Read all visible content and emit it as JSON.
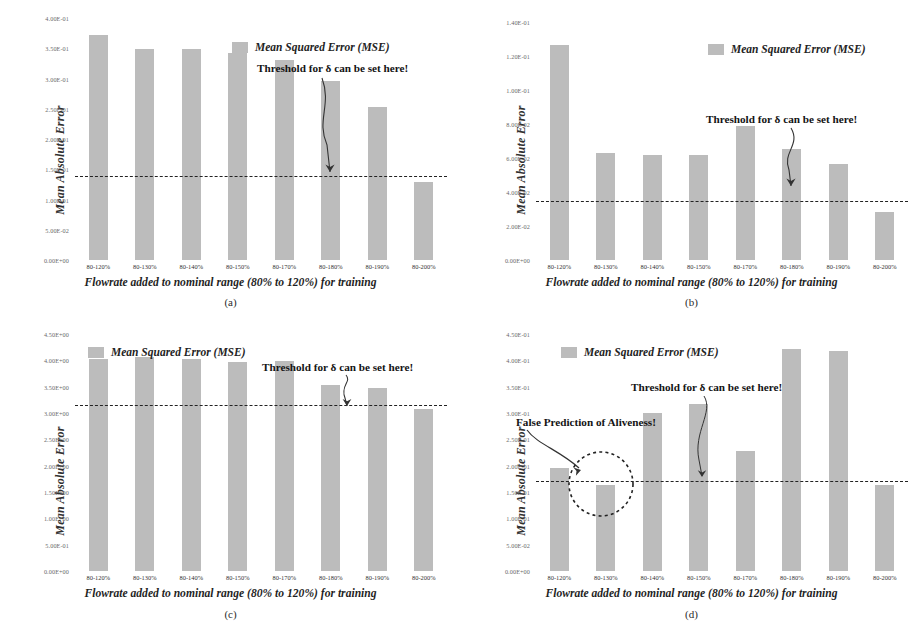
{
  "figure": {
    "bar_color": "#bcbcbc",
    "threshold_color": "#222222",
    "legend_label": "Mean Squared Error (MSE)",
    "ylabel": "Mean Absolute Error",
    "xtitle": "Flowrate added to nominal range (80% to 120%) for training",
    "threshold_annotation": "Threshold for δ can be set here!",
    "false_prediction_annotation": "False Prediction of Aliveness!"
  },
  "panels": [
    {
      "id": "a",
      "label": "(a)",
      "chart_data": {
        "type": "bar",
        "title": "",
        "xlabel": "Flowrate added to nominal range (80% to 120%) for training",
        "ylabel": "Mean Absolute Error",
        "legend": [
          "Mean Squared Error (MSE)"
        ],
        "legend_position": "top-right",
        "grid": false,
        "categories": [
          "80-120%",
          "80-130%",
          "80-140%",
          "80-150%",
          "80-170%",
          "80-180%",
          "80-190%",
          "80-200%"
        ],
        "values": [
          0.372,
          0.348,
          0.349,
          0.343,
          0.33,
          0.296,
          0.253,
          0.129
        ],
        "ylim": [
          0,
          0.4
        ],
        "ytick_values": [
          0.4,
          0.35,
          0.3,
          0.25,
          0.2,
          0.15,
          0.1,
          0.05,
          0.0
        ],
        "ytick_labels": [
          "4.00E-01",
          "3.50E-01",
          "3.00E-01",
          "2.50E-01",
          "2.00E-01",
          "1.50E-01",
          "1.00E-01",
          "5.00E-02",
          "0.00E+00"
        ],
        "threshold": 0.1395,
        "annotations": [
          "Threshold for δ can be set here!"
        ]
      }
    },
    {
      "id": "b",
      "label": "(b)",
      "chart_data": {
        "type": "bar",
        "title": "",
        "xlabel": "Flowrate added to nominal range (80% to 120%) for training",
        "ylabel": "Mean Absolute Error",
        "legend": [
          "Mean Squared Error (MSE)"
        ],
        "legend_position": "top-right",
        "grid": false,
        "categories": [
          "80-120%",
          "80-130%",
          "80-140%",
          "80-150%",
          "80-170%",
          "80-180%",
          "80-190%",
          "80-200%"
        ],
        "values": [
          0.1265,
          0.063,
          0.062,
          0.062,
          0.079,
          0.0655,
          0.0565,
          0.028
        ],
        "ylim": [
          0,
          0.14
        ],
        "ytick_values": [
          0.14,
          0.12,
          0.1,
          0.08,
          0.06,
          0.04,
          0.02,
          0.0
        ],
        "ytick_labels": [
          "1.40E-01",
          "1.20E-01",
          "1.00E-01",
          "8.00E-02",
          "6.00E-02",
          "4.00E-02",
          "2.00E-02",
          "0.00E+00"
        ],
        "threshold": 0.0345,
        "annotations": [
          "Threshold for δ can be set here!"
        ]
      }
    },
    {
      "id": "c",
      "label": "(c)",
      "chart_data": {
        "type": "bar",
        "title": "",
        "xlabel": "Flowrate added to nominal range (80% to 120%) for training",
        "ylabel": "Mean Absolute Error",
        "legend": [
          "Mean Squared Error (MSE)"
        ],
        "legend_position": "top-left",
        "grid": false,
        "categories": [
          "80-120%",
          "80-130%",
          "80-140%",
          "80-150%",
          "80-170%",
          "80-180%",
          "80-190%",
          "80-200%"
        ],
        "values": [
          4.02,
          4.07,
          4.02,
          3.96,
          3.98,
          3.53,
          3.47,
          3.08
        ],
        "ylim": [
          0,
          4.5
        ],
        "ytick_values": [
          4.5,
          4.0,
          3.5,
          3.0,
          2.5,
          2.0,
          1.5,
          1.0,
          0.5,
          0.0
        ],
        "ytick_labels": [
          "4.50E+00",
          "4.00E+00",
          "3.50E+00",
          "3.00E+00",
          "2.50E+00",
          "2.00E+00",
          "1.50E+00",
          "1.00E+00",
          "5.00E-01",
          "0.00E+00"
        ],
        "threshold": 3.15,
        "annotations": [
          "Threshold for δ can be set here!"
        ]
      }
    },
    {
      "id": "d",
      "label": "(d)",
      "chart_data": {
        "type": "bar",
        "title": "",
        "xlabel": "Flowrate added to nominal range (80% to 120%) for training",
        "ylabel": "Mean Absolute Error",
        "legend": [
          "Mean Squared Error (MSE)"
        ],
        "legend_position": "top-left",
        "grid": false,
        "categories": [
          "80-120%",
          "80-130%",
          "80-140%",
          "80-150%",
          "80-170%",
          "80-180%",
          "80-190%",
          "80-200%"
        ],
        "values": [
          0.196,
          0.163,
          0.3,
          0.317,
          0.228,
          0.421,
          0.417,
          0.163
        ],
        "ylim": [
          0,
          0.45
        ],
        "ytick_values": [
          0.45,
          0.4,
          0.35,
          0.3,
          0.25,
          0.2,
          0.15,
          0.1,
          0.05,
          0.0
        ],
        "ytick_labels": [
          "4.50E-01",
          "4.00E-01",
          "3.50E-01",
          "3.00E-01",
          "2.50E-01",
          "2.00E-01",
          "1.50E-01",
          "1.00E-01",
          "5.00E-02",
          "0.00E+00"
        ],
        "threshold": 0.171,
        "annotations": [
          "Threshold for δ can be set here!",
          "False Prediction of Aliveness!"
        ],
        "highlight": {
          "category": "80-130%",
          "note": "False Prediction of Aliveness!"
        }
      }
    }
  ]
}
